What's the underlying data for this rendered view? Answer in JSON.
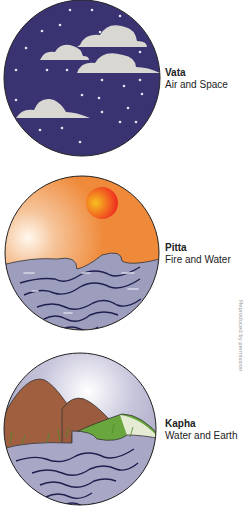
{
  "doshas": [
    {
      "name": "Vata",
      "description": "Air and Space",
      "colors": {
        "sky": "#3a3372",
        "cloud": "#d8d6d0"
      }
    },
    {
      "name": "Pitta",
      "description": "Fire and Water",
      "colors": {
        "sky": "#ef8a3a",
        "sun": "#f04020",
        "water": "#9d9dbd"
      }
    },
    {
      "name": "Kapha",
      "description": "Water and Earth",
      "colors": {
        "sky": "#a9a6c4",
        "hill": "#9b5b3e",
        "grass": "#5ea33a",
        "water": "#a8a8c6"
      }
    }
  ],
  "credit": "Reproduced by permission"
}
